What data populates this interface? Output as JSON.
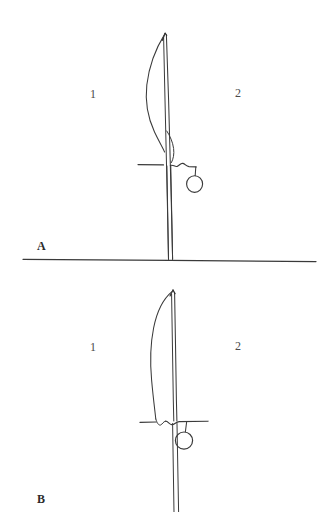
{
  "plate": {
    "title": "Two sabre line drawings",
    "background_color": "#ffffff",
    "ink_color": "#3a3a3a",
    "width": 335,
    "height": 512
  },
  "figures": [
    {
      "id": "A",
      "label": "A",
      "label_position": {
        "x": 37,
        "y": 239
      },
      "part_labels": [
        {
          "id": "A1",
          "text": "1",
          "x": 90,
          "y": 87
        },
        {
          "id": "A2",
          "text": "2",
          "x": 235,
          "y": 86
        }
      ],
      "description": "Sabre, point upward, curved cutting edge at left, straight back at right, cross-guard with suspension ring to the right of the grip."
    },
    {
      "id": "B",
      "label": "B",
      "label_position": {
        "x": 37,
        "y": 492
      },
      "part_labels": [
        {
          "id": "B1",
          "text": "1",
          "x": 90,
          "y": 340
        },
        {
          "id": "B2",
          "text": "2",
          "x": 235,
          "y": 339
        }
      ],
      "description": "Sabre, point upward, broader curved blade at left, straight back at right, cross-guard with suspension ring to the right of the grip."
    }
  ],
  "divider": {
    "name": "panel-divider-line",
    "x1": 23,
    "y1": 259,
    "x2": 316,
    "y2": 261
  }
}
